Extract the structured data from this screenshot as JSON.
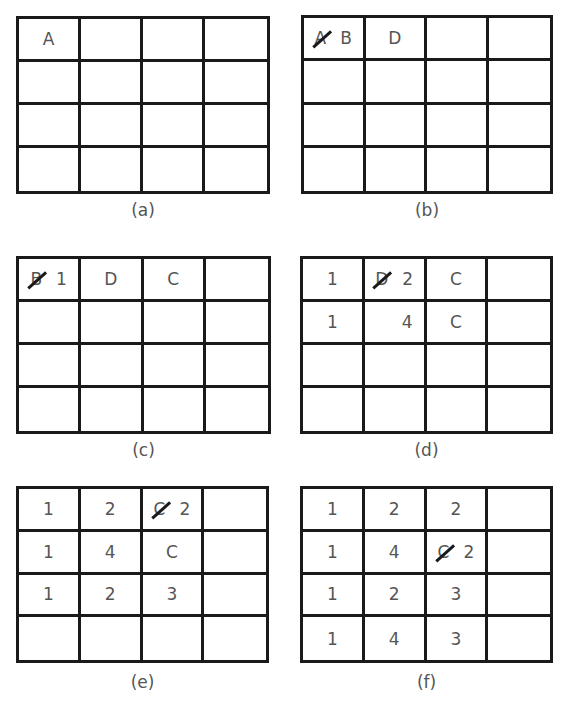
{
  "figure": {
    "panels": [
      {
        "id": "a",
        "caption": "(a)",
        "cells": [
          [
            {
              "struck": "",
              "value": "A"
            },
            {
              "struck": "",
              "value": ""
            },
            {
              "struck": "",
              "value": ""
            },
            {
              "struck": "",
              "value": ""
            }
          ],
          [
            {
              "struck": "",
              "value": ""
            },
            {
              "struck": "",
              "value": ""
            },
            {
              "struck": "",
              "value": ""
            },
            {
              "struck": "",
              "value": ""
            }
          ],
          [
            {
              "struck": "",
              "value": ""
            },
            {
              "struck": "",
              "value": ""
            },
            {
              "struck": "",
              "value": ""
            },
            {
              "struck": "",
              "value": ""
            }
          ],
          [
            {
              "struck": "",
              "value": ""
            },
            {
              "struck": "",
              "value": ""
            },
            {
              "struck": "",
              "value": ""
            },
            {
              "struck": "",
              "value": ""
            }
          ]
        ]
      },
      {
        "id": "b",
        "caption": "(b)",
        "cells": [
          [
            {
              "struck": "A",
              "value": "B"
            },
            {
              "struck": "",
              "value": "D"
            },
            {
              "struck": "",
              "value": ""
            },
            {
              "struck": "",
              "value": ""
            }
          ],
          [
            {
              "struck": "",
              "value": ""
            },
            {
              "struck": "",
              "value": ""
            },
            {
              "struck": "",
              "value": ""
            },
            {
              "struck": "",
              "value": ""
            }
          ],
          [
            {
              "struck": "",
              "value": ""
            },
            {
              "struck": "",
              "value": ""
            },
            {
              "struck": "",
              "value": ""
            },
            {
              "struck": "",
              "value": ""
            }
          ],
          [
            {
              "struck": "",
              "value": ""
            },
            {
              "struck": "",
              "value": ""
            },
            {
              "struck": "",
              "value": ""
            },
            {
              "struck": "",
              "value": ""
            }
          ]
        ]
      },
      {
        "id": "c",
        "caption": "(c)",
        "cells": [
          [
            {
              "struck": "B",
              "value": "1"
            },
            {
              "struck": "",
              "value": "D"
            },
            {
              "struck": "",
              "value": "C"
            },
            {
              "struck": "",
              "value": ""
            }
          ],
          [
            {
              "struck": "",
              "value": ""
            },
            {
              "struck": "",
              "value": ""
            },
            {
              "struck": "",
              "value": ""
            },
            {
              "struck": "",
              "value": ""
            }
          ],
          [
            {
              "struck": "",
              "value": ""
            },
            {
              "struck": "",
              "value": ""
            },
            {
              "struck": "",
              "value": ""
            },
            {
              "struck": "",
              "value": ""
            }
          ],
          [
            {
              "struck": "",
              "value": ""
            },
            {
              "struck": "",
              "value": ""
            },
            {
              "struck": "",
              "value": ""
            },
            {
              "struck": "",
              "value": ""
            }
          ]
        ]
      },
      {
        "id": "d",
        "caption": "(d)",
        "cells": [
          [
            {
              "struck": "",
              "value": "1"
            },
            {
              "struck": "D",
              "value": "2"
            },
            {
              "struck": "",
              "value": "C"
            },
            {
              "struck": "",
              "value": ""
            }
          ],
          [
            {
              "struck": "",
              "value": "1"
            },
            {
              "struck": "",
              "value": "4",
              "offset": "right"
            },
            {
              "struck": "",
              "value": "C"
            },
            {
              "struck": "",
              "value": ""
            }
          ],
          [
            {
              "struck": "",
              "value": ""
            },
            {
              "struck": "",
              "value": ""
            },
            {
              "struck": "",
              "value": ""
            },
            {
              "struck": "",
              "value": ""
            }
          ],
          [
            {
              "struck": "",
              "value": ""
            },
            {
              "struck": "",
              "value": ""
            },
            {
              "struck": "",
              "value": ""
            },
            {
              "struck": "",
              "value": ""
            }
          ]
        ]
      },
      {
        "id": "e",
        "caption": "(e)",
        "cells": [
          [
            {
              "struck": "",
              "value": "1"
            },
            {
              "struck": "",
              "value": "2"
            },
            {
              "struck": "C",
              "value": "2"
            },
            {
              "struck": "",
              "value": ""
            }
          ],
          [
            {
              "struck": "",
              "value": "1"
            },
            {
              "struck": "",
              "value": "4"
            },
            {
              "struck": "",
              "value": "C"
            },
            {
              "struck": "",
              "value": ""
            }
          ],
          [
            {
              "struck": "",
              "value": "1"
            },
            {
              "struck": "",
              "value": "2"
            },
            {
              "struck": "",
              "value": "3"
            },
            {
              "struck": "",
              "value": ""
            }
          ],
          [
            {
              "struck": "",
              "value": ""
            },
            {
              "struck": "",
              "value": ""
            },
            {
              "struck": "",
              "value": ""
            },
            {
              "struck": "",
              "value": ""
            }
          ]
        ]
      },
      {
        "id": "f",
        "caption": "(f)",
        "cells": [
          [
            {
              "struck": "",
              "value": "1"
            },
            {
              "struck": "",
              "value": "2"
            },
            {
              "struck": "",
              "value": "2"
            },
            {
              "struck": "",
              "value": ""
            }
          ],
          [
            {
              "struck": "",
              "value": "1"
            },
            {
              "struck": "",
              "value": "4"
            },
            {
              "struck": "C",
              "value": "2"
            },
            {
              "struck": "",
              "value": ""
            }
          ],
          [
            {
              "struck": "",
              "value": "1"
            },
            {
              "struck": "",
              "value": "2"
            },
            {
              "struck": "",
              "value": "3"
            },
            {
              "struck": "",
              "value": ""
            }
          ],
          [
            {
              "struck": "",
              "value": "1"
            },
            {
              "struck": "",
              "value": "4"
            },
            {
              "struck": "",
              "value": "3"
            },
            {
              "struck": "",
              "value": ""
            }
          ]
        ]
      }
    ]
  }
}
